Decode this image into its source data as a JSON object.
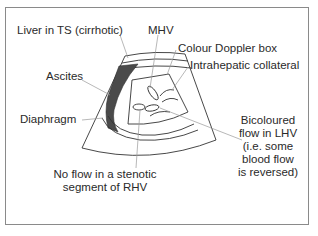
{
  "diagram": {
    "type": "ultrasound-schematic",
    "colors": {
      "frame": "#8a8a8a",
      "line": "#333333",
      "leader": "#9a9a9a",
      "ascites_fill": "#4a4a4a",
      "text": "#2a2a2a"
    },
    "labels": {
      "liver": "Liver in TS (cirrhotic)",
      "mhv": "MHV",
      "doppler_box": "Colour Doppler box",
      "collateral": "Intrahepatic collateral",
      "ascites": "Ascites",
      "diaphragm": "Diaphragm",
      "bicoloured": [
        "Bicoloured",
        "flow in LHV",
        "(i.e. some",
        "blood flow",
        "is reversed)"
      ],
      "no_flow": [
        "No flow in a stenotic",
        "segment of RHV"
      ]
    }
  }
}
